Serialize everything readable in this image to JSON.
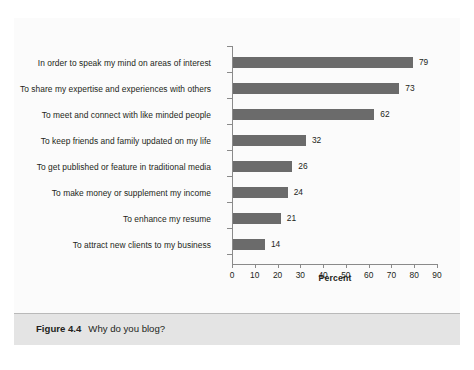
{
  "figure": {
    "caption_number": "Figure 4.4",
    "caption_title": "Why do you blog?"
  },
  "chart_data": {
    "type": "bar",
    "orientation": "horizontal",
    "title": "",
    "xlabel": "Percent",
    "ylabel": "",
    "xlim": [
      0,
      90
    ],
    "xticks": [
      0,
      10,
      20,
      30,
      40,
      50,
      60,
      70,
      80,
      90
    ],
    "grid": false,
    "legend": false,
    "bar_color": "#6b6b6b",
    "categories": [
      "In order to speak my mind on areas of interest",
      "To share my expertise and experiences with others",
      "To meet and connect with like minded people",
      "To keep friends and family updated on my life",
      "To get published or feature in traditional media",
      "To make money or supplement my income",
      "To enhance my resume",
      "To attract new clients to my business"
    ],
    "values": [
      79,
      73,
      62,
      32,
      26,
      24,
      21,
      14
    ],
    "value_labels": [
      "79",
      "73",
      "62",
      "32",
      "26",
      "24",
      "21",
      "14"
    ]
  }
}
